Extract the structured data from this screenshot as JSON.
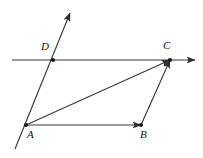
{
  "figure": {
    "background_color": "#ffffff",
    "stroke_color": "#3a3a3a",
    "label_color": "#111111"
  },
  "points": {
    "A": {
      "label": "A",
      "x": 26,
      "y": 125,
      "label_x": 27,
      "label_y": 129
    },
    "B": {
      "label": "B",
      "x": 141,
      "y": 125,
      "label_x": 140,
      "label_y": 129
    },
    "C": {
      "label": "C",
      "x": 170,
      "y": 60,
      "label_x": 163,
      "label_y": 40
    },
    "D": {
      "label": "D",
      "x": 53,
      "y": 60,
      "label_x": 41,
      "label_y": 41
    }
  },
  "segments": [
    {
      "name": "ray-through-D",
      "from": "line-start-below-A",
      "to": "arrow-top",
      "x1": 15,
      "y1": 149,
      "x2": 70,
      "y2": 13,
      "arrow": "end"
    },
    {
      "name": "line-through-D-and-C",
      "from": "left-edge",
      "to": "arrow-right",
      "x1": 12,
      "y1": 60,
      "x2": 195,
      "y2": 60,
      "arrow": "end"
    },
    {
      "name": "vector-AB",
      "from": "A",
      "to": "B",
      "x1": 26,
      "y1": 125,
      "x2": 141,
      "y2": 125,
      "arrow": "end"
    },
    {
      "name": "vector-AC",
      "from": "A",
      "to": "C",
      "x1": 26,
      "y1": 125,
      "x2": 170,
      "y2": 60,
      "arrow": "end"
    },
    {
      "name": "vector-BC",
      "from": "B",
      "to": "C",
      "x1": 141,
      "y1": 125,
      "x2": 170,
      "y2": 60,
      "arrow": "end"
    }
  ],
  "dots": [
    {
      "name": "dot-A",
      "x": 26,
      "y": 125
    },
    {
      "name": "dot-B",
      "x": 141,
      "y": 125
    },
    {
      "name": "dot-C",
      "x": 170,
      "y": 60
    },
    {
      "name": "dot-D",
      "x": 53,
      "y": 60
    }
  ]
}
